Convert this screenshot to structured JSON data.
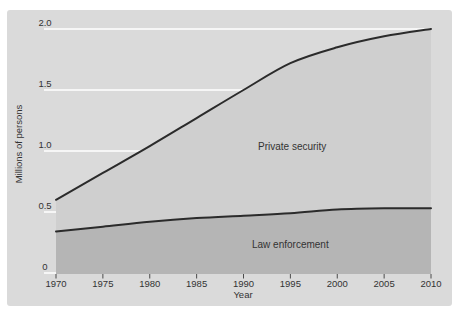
{
  "figure": {
    "background": "#ffffff",
    "panel_color": "#dadada"
  },
  "chart_data": {
    "type": "area",
    "title": "",
    "x": [
      1970,
      1975,
      1980,
      1985,
      1990,
      1995,
      2000,
      2005,
      2010
    ],
    "xtick_labels": [
      "1970",
      "1975",
      "1980",
      "1985",
      "1990",
      "1995",
      "2000",
      "2005",
      "2010"
    ],
    "series": [
      {
        "name": "Private security",
        "values": [
          0.6,
          0.82,
          1.04,
          1.27,
          1.5,
          1.72,
          1.85,
          1.94,
          2.0
        ],
        "fill_color": "#cfcfcf",
        "line_color": "#2b2b2b"
      },
      {
        "name": "Law enforcement",
        "values": [
          0.34,
          0.38,
          0.42,
          0.45,
          0.47,
          0.49,
          0.52,
          0.53,
          0.53
        ],
        "fill_color": "#b5b5b5",
        "line_color": "#2b2b2b"
      }
    ],
    "xlabel": "Year",
    "ylabel": "Millions of persons",
    "ylim": [
      0,
      2.0
    ],
    "yticks": [
      0,
      0.5,
      1.0,
      1.5,
      2.0
    ],
    "ytick_labels": [
      "0",
      "0.5",
      "1.0",
      "1.5",
      "2.0"
    ],
    "grid": "on",
    "gridline_color": "#ffffff",
    "tick_mark_color": "#4a4a4a",
    "text_color": "#333333",
    "legend_position": "inline-area-labels"
  }
}
